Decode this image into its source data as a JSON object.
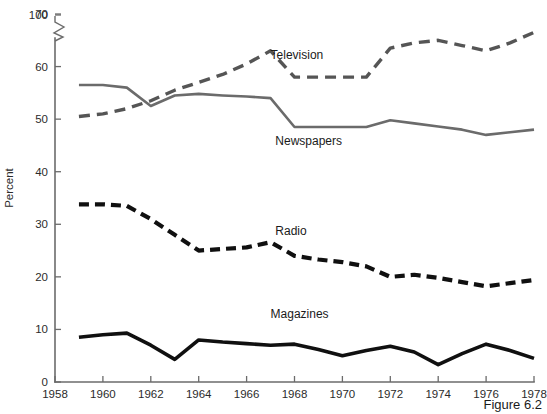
{
  "figure": {
    "caption": "Figure 6.2"
  },
  "chart_data": {
    "type": "line",
    "title": "",
    "xlabel": "",
    "ylabel": "Percent",
    "x": [
      1959,
      1960,
      1961,
      1962,
      1963,
      1964,
      1965,
      1966,
      1967,
      1968,
      1969,
      1970,
      1971,
      1972,
      1973,
      1974,
      1975,
      1976,
      1977,
      1978
    ],
    "xlim": [
      1958,
      1978
    ],
    "ylim": [
      0,
      70
    ],
    "y_axis_break": {
      "present": true,
      "below": 70,
      "above": 100,
      "note": "zigzag break between 70 and 100"
    },
    "xticks": [
      1958,
      1960,
      1962,
      1964,
      1966,
      1968,
      1970,
      1972,
      1974,
      1976,
      1978
    ],
    "xtick_labels": [
      "1958",
      "1960",
      "1962",
      "1964",
      "1966",
      "1968",
      "1970",
      "1972",
      "1974",
      "1976",
      "1978"
    ],
    "yticks": [
      0,
      10,
      20,
      30,
      40,
      50,
      60,
      70,
      100
    ],
    "ytick_labels": [
      "0",
      "10",
      "20",
      "30",
      "40",
      "50",
      "60",
      "70",
      "100"
    ],
    "grid": false,
    "legend_position": "inline-labels",
    "series": [
      {
        "name": "Television",
        "label": "Television",
        "color": "#555555",
        "style": "dashed",
        "dash": "11,7",
        "width": 3.4,
        "label_x": 1967.0,
        "label_y": 61.5,
        "values": [
          50.5,
          51.0,
          52.0,
          53.5,
          55.5,
          57.0,
          58.5,
          60.5,
          63.0,
          58.0,
          58.0,
          58.0,
          58.0,
          63.5,
          64.5,
          65.0,
          64.0,
          63.0,
          64.5,
          66.5
        ]
      },
      {
        "name": "Newspapers",
        "label": "Newspapers",
        "color": "#6b6b6b",
        "style": "solid",
        "dash": "",
        "width": 2.6,
        "label_x": 1967.2,
        "label_y": 45.0,
        "values": [
          56.5,
          56.5,
          56.0,
          52.5,
          54.5,
          54.8,
          54.5,
          54.3,
          54.0,
          48.5,
          48.5,
          48.5,
          48.5,
          49.8,
          49.2,
          48.6,
          48.0,
          47.0,
          47.5,
          48.0
        ]
      },
      {
        "name": "Radio",
        "label": "Radio",
        "color": "#101010",
        "style": "dashed",
        "dash": "10,6",
        "width": 4.2,
        "label_x": 1967.2,
        "label_y": 28.0,
        "values": [
          33.8,
          33.8,
          33.5,
          31.0,
          28.0,
          25.0,
          25.3,
          25.6,
          26.6,
          24.0,
          23.3,
          22.8,
          22.0,
          20.0,
          20.4,
          19.8,
          19.0,
          18.2,
          18.8,
          19.4
        ]
      },
      {
        "name": "Magazines",
        "label": "Magazines",
        "color": "#101010",
        "style": "solid",
        "dash": "",
        "width": 3.6,
        "label_x": 1967.0,
        "label_y": 12.2,
        "values": [
          8.5,
          9.0,
          9.3,
          7.0,
          4.3,
          8.0,
          7.6,
          7.3,
          7.0,
          7.2,
          6.2,
          5.0,
          6.0,
          6.8,
          5.7,
          3.3,
          5.4,
          7.2,
          6.0,
          4.5
        ]
      }
    ]
  },
  "layout": {
    "plot_left": 55,
    "plot_right": 534,
    "plot_top": 14,
    "plot_bottom": 382,
    "y_top_value": 70,
    "y_bottom_value": 0,
    "break_label_y": 14,
    "break_top_y": 22,
    "break_bottom_y": 38,
    "tick_len": 6
  }
}
